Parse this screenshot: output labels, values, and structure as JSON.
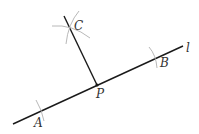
{
  "diagram": {
    "colors": {
      "line": "#1a1a1a",
      "arc": "#b0b0b0",
      "label": "#333333"
    },
    "line_label": "l",
    "points": {
      "A": {
        "label": "A"
      },
      "B": {
        "label": "B"
      },
      "C": {
        "label": "C"
      },
      "P": {
        "label": "P"
      }
    }
  }
}
